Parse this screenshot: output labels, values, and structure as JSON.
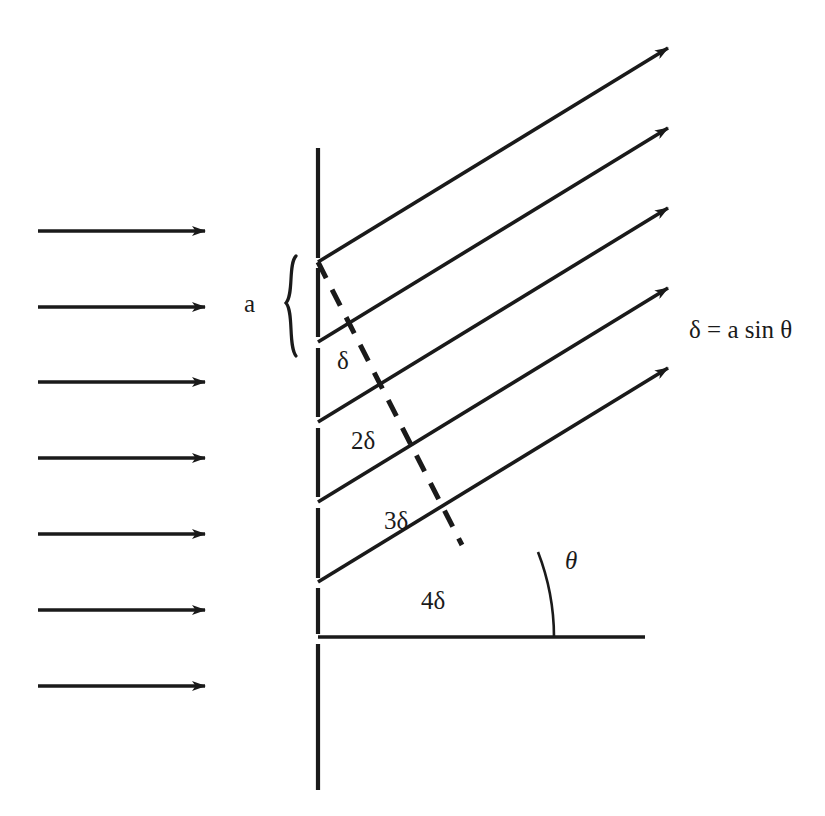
{
  "figure": {
    "type": "optics-diagram",
    "background_color": "#ffffff",
    "ink_color": "#1a1a1a"
  },
  "labels": {
    "slit_width": "a",
    "path_difference_1": "δ",
    "path_difference_2": "2δ",
    "path_difference_3": "3δ",
    "path_difference_4": "4δ",
    "angle": "θ",
    "equation": "δ = a sin θ"
  },
  "incident_wave": {
    "description": "plane-wave-arrows",
    "count": 7,
    "direction": "left-to-right",
    "arrow_start_x": 38,
    "arrow_end_x": 205,
    "arrow_y_positions": [
      231,
      307,
      382,
      458,
      534,
      610,
      686
    ]
  },
  "barrier": {
    "description": "grating-screen-vertical-dashed",
    "x": 318,
    "top_y": 148,
    "bottom_y": 790,
    "segments": [
      {
        "y1": 148,
        "y2": 258
      },
      {
        "y1": 268,
        "y2": 337
      },
      {
        "y1": 348,
        "y2": 417
      },
      {
        "y1": 428,
        "y2": 497
      },
      {
        "y1": 508,
        "y2": 578
      },
      {
        "y1": 588,
        "y2": 634
      },
      {
        "y1": 644,
        "y2": 790
      }
    ],
    "slit_y_positions": [
      262,
      342,
      422,
      502,
      582,
      638
    ]
  },
  "diffracted_rays": {
    "description": "parallel-outgoing-rays",
    "count": 5,
    "angle_degrees": 21,
    "origin_x": 318,
    "rays": [
      {
        "origin_y": 262,
        "tip_x": 668,
        "tip_y": 48,
        "label": "δ"
      },
      {
        "origin_y": 342,
        "tip_x": 668,
        "tip_y": 128,
        "label": "2δ"
      },
      {
        "origin_y": 422,
        "tip_x": 668,
        "tip_y": 208,
        "label": "3δ"
      },
      {
        "origin_y": 502,
        "tip_x": 668,
        "tip_y": 288,
        "label": "4δ"
      },
      {
        "origin_y": 582,
        "tip_x": 668,
        "tip_y": 368,
        "label": ""
      }
    ]
  },
  "wavefront": {
    "description": "dashed-wavefront-perpendicular-to-rays",
    "style": "dashed",
    "x1": 318,
    "y1": 262,
    "x2": 462,
    "y2": 545
  },
  "brace": {
    "description": "curly-brace-marking-slit-spacing",
    "x": 288,
    "top_y": 256,
    "bottom_y": 356
  },
  "reference_line": {
    "description": "horizontal-baseline-for-angle",
    "x1": 318,
    "x2": 645,
    "y": 637
  },
  "angle_arc": {
    "description": "theta-angle-arc-between-ray-and-baseline",
    "vertex_x": 318,
    "vertex_y": 637,
    "radius": 236
  }
}
